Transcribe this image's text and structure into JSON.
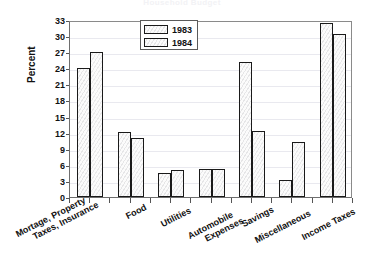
{
  "chart_data": {
    "type": "bar",
    "title": "Household Budget",
    "xlabel": "",
    "ylabel": "Percent",
    "ylim": [
      0,
      33
    ],
    "yticks": [
      0,
      3,
      6,
      9,
      12,
      15,
      18,
      21,
      24,
      27,
      30,
      33
    ],
    "grid": true,
    "legend_position": "top-center",
    "categories": [
      "Mortage, Property Taxes, Insurance",
      "Food",
      "Utilities",
      "Automobile Expenses",
      "Savings",
      "Miscellaneous",
      "Income Taxes"
    ],
    "category_lines": [
      [
        "Mortage, Property",
        "Taxes, Insurance"
      ],
      [
        "Food",
        ""
      ],
      [
        "Utilities",
        ""
      ],
      [
        "Automobile",
        "Expenses"
      ],
      [
        "Savings",
        ""
      ],
      [
        "Miscellaneous",
        ""
      ],
      [
        "Income Taxes",
        ""
      ]
    ],
    "series": [
      {
        "name": "1983",
        "values": [
          24.0,
          12.1,
          4.5,
          5.2,
          25.2,
          3.2,
          32.5
        ]
      },
      {
        "name": "1984",
        "values": [
          27.0,
          11.0,
          5.1,
          5.2,
          12.3,
          10.3,
          30.4
        ]
      }
    ]
  },
  "legend": {
    "entries": [
      {
        "label": "1983"
      },
      {
        "label": "1984"
      }
    ]
  }
}
